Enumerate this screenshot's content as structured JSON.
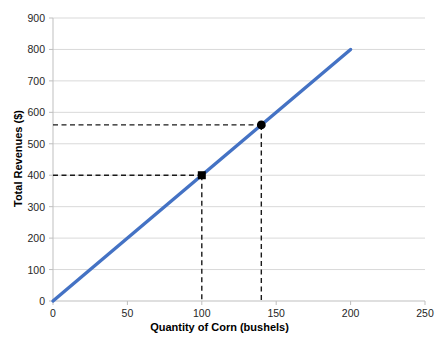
{
  "chart_data": {
    "type": "line",
    "title": "",
    "xlabel": "Quantity of Corn (bushels)",
    "ylabel": "Total Revenues ($)",
    "xlim": [
      0,
      250
    ],
    "ylim": [
      0,
      900
    ],
    "xticks": [
      0,
      50,
      100,
      150,
      200,
      250
    ],
    "yticks": [
      0,
      100,
      200,
      300,
      400,
      500,
      600,
      700,
      800,
      900
    ],
    "grid": "horizontal",
    "legend": "none",
    "series": [
      {
        "name": "Total Revenue",
        "color": "#4472C4",
        "x": [
          0,
          200
        ],
        "values": [
          0,
          800
        ],
        "slope_price_per_bushel": 4
      }
    ],
    "annotations": [
      {
        "name": "point-100",
        "x": 100,
        "y": 400,
        "marker": "black-square",
        "guide_lines": "dashed"
      },
      {
        "name": "point-140",
        "x": 140,
        "y": 560,
        "marker": "black-circle",
        "guide_lines": "dashed"
      }
    ]
  },
  "axes": {
    "x_tick_labels": [
      "0",
      "50",
      "100",
      "150",
      "200",
      "250"
    ],
    "y_tick_labels": [
      "0",
      "100",
      "200",
      "300",
      "400",
      "500",
      "600",
      "700",
      "800",
      "900"
    ],
    "x_title": "Quantity of Corn (bushels)",
    "y_title": "Total Revenues ($)"
  },
  "colors": {
    "line": "#4472C4",
    "grid": "#D9D9D9",
    "axis": "#BFBFBF",
    "dash": "#1A1A1A",
    "marker": "#000000",
    "text": "#262626",
    "background": "#FFFFFF"
  }
}
